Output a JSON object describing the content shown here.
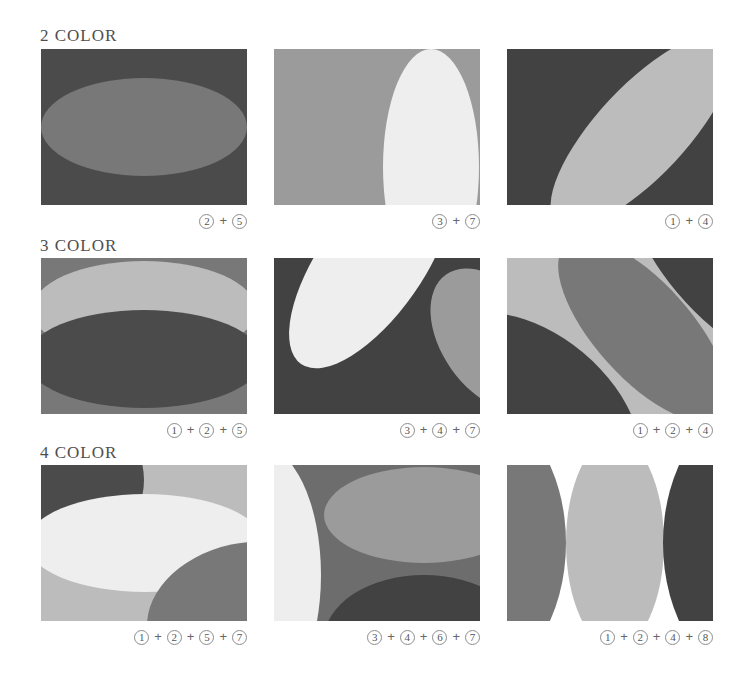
{
  "plus_sign": "+",
  "palette": {
    "1": "#bcbcbc",
    "2": "#787878",
    "3": "#9b9b9b",
    "4": "#424242",
    "5": "#4b4b4b",
    "6": "#6d6d6d",
    "7": "#eeeeee",
    "8": "#ffffff"
  },
  "rows": [
    {
      "title": "2 COLOR",
      "panels": [
        {
          "combo": [
            "2",
            "5"
          ],
          "background": "5",
          "shapes": [
            {
              "swatch": "2",
              "cx": 103,
              "cy": 78,
              "rx": 103,
              "ry": 49,
              "rot": 0
            }
          ]
        },
        {
          "combo": [
            "3",
            "7"
          ],
          "background": "3",
          "shapes": [
            {
              "swatch": "7",
              "cx": 157,
              "cy": 118,
              "rx": 48,
              "ry": 118,
              "rot": 0
            }
          ]
        },
        {
          "combo": [
            "1",
            "4"
          ],
          "background": "4",
          "shapes": [
            {
              "swatch": "1",
              "cx": 135,
              "cy": 82,
              "rx": 125,
              "ry": 45,
              "rot": -47
            }
          ]
        }
      ]
    },
    {
      "title": "3 COLOR",
      "panels": [
        {
          "combo": [
            "1",
            "2",
            "5"
          ],
          "background": "2",
          "shapes": [
            {
              "swatch": "1",
              "cx": 103,
              "cy": 52,
              "rx": 112,
              "ry": 49,
              "rot": 0
            },
            {
              "swatch": "5",
              "cx": 103,
              "cy": 101,
              "rx": 118,
              "ry": 49,
              "rot": 0
            }
          ]
        },
        {
          "combo": [
            "3",
            "4",
            "7"
          ],
          "background": "4",
          "shapes": [
            {
              "swatch": "7",
              "cx": 97,
              "cy": 6,
              "rx": 122,
              "ry": 52,
              "rot": -55
            },
            {
              "swatch": "3",
              "cx": 218,
              "cy": 82,
              "rx": 80,
              "ry": 50,
              "rot": 55
            }
          ]
        },
        {
          "combo": [
            "1",
            "2",
            "4"
          ],
          "background": "1",
          "shapes": [
            {
              "swatch": "4",
              "cx": 226,
              "cy": 14,
              "rx": 130,
              "ry": 55,
              "rot": 45
            },
            {
              "swatch": "4",
              "cx": 30,
              "cy": 150,
              "rx": 120,
              "ry": 72,
              "rot": 40
            },
            {
              "swatch": "2",
              "cx": 136,
              "cy": 72,
              "rx": 115,
              "ry": 48,
              "rot": 48
            }
          ]
        }
      ]
    },
    {
      "title": "4 COLOR",
      "panels": [
        {
          "combo": [
            "1",
            "2",
            "5",
            "7"
          ],
          "background": "1",
          "shapes": [
            {
              "swatch": "5",
              "cx": 15,
              "cy": 15,
              "rx": 88,
              "ry": 80,
              "rot": 0
            },
            {
              "swatch": "7",
              "cx": 104,
              "cy": 78,
              "rx": 118,
              "ry": 49,
              "rot": 0
            },
            {
              "swatch": "2",
              "cx": 205,
              "cy": 150,
              "rx": 100,
              "ry": 72,
              "rot": -12
            }
          ]
        },
        {
          "combo": [
            "3",
            "4",
            "6",
            "7"
          ],
          "background": "6",
          "shapes": [
            {
              "swatch": "7",
              "cx": -15,
              "cy": 110,
              "rx": 62,
              "ry": 130,
              "rot": 0
            },
            {
              "swatch": "3",
              "cx": 150,
              "cy": 50,
              "rx": 100,
              "ry": 48,
              "rot": 0
            },
            {
              "swatch": "4",
              "cx": 150,
              "cy": 175,
              "rx": 100,
              "ry": 65,
              "rot": 0
            }
          ]
        },
        {
          "combo": [
            "1",
            "2",
            "4",
            "8"
          ],
          "background": "8",
          "shapes": [
            {
              "swatch": "2",
              "cx": -30,
              "cy": 78,
              "rx": 89,
              "ry": 136,
              "rot": 0
            },
            {
              "swatch": "1",
              "cx": 108,
              "cy": 78,
              "rx": 49,
              "ry": 105,
              "rot": 0
            },
            {
              "swatch": "4",
              "cx": 245,
              "cy": 78,
              "rx": 89,
              "ry": 136,
              "rot": 0
            }
          ]
        }
      ]
    }
  ]
}
